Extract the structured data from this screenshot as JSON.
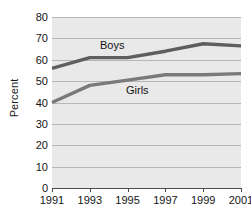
{
  "chart_data": {
    "type": "line",
    "title": "",
    "subtitle": "",
    "xlabel": "",
    "ylabel": "Percent",
    "x": [
      1991,
      1993,
      1995,
      1997,
      1999,
      2001
    ],
    "categories": [
      "1991",
      "1993",
      "1995",
      "1997",
      "1999",
      "2001"
    ],
    "xlim": [
      1991,
      2001
    ],
    "ylim": [
      0,
      80
    ],
    "y_ticks": [
      0,
      10,
      20,
      30,
      40,
      50,
      60,
      70,
      80
    ],
    "y_tick_labels": [
      "0",
      "10",
      "20",
      "30",
      "40",
      "50",
      "60",
      "70",
      "80"
    ],
    "x_tick_labels": [
      "1991",
      "1993",
      "1995",
      "1997",
      "1999",
      "2001"
    ],
    "grid": true,
    "grid_axis": "y",
    "legend": "inline-labels",
    "series": [
      {
        "name": "Boys",
        "label": "Boys",
        "color": "#5e5e5e",
        "values": [
          56,
          61,
          61,
          64,
          67.5,
          66.5
        ]
      },
      {
        "name": "Girls",
        "label": "Girls",
        "color": "#7a7a7a",
        "values": [
          40,
          48,
          50.5,
          53,
          53,
          53.5
        ]
      }
    ],
    "plot_background": "#e9e9e9",
    "gridline_color": "#b7b7b7",
    "axis_color": "#4a4a4a",
    "text_color": "#141414"
  }
}
